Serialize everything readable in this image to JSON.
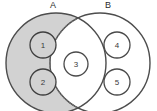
{
  "diagram": {
    "type": "venn-two-set",
    "width": 157,
    "height": 111,
    "background_color": "#ffffff",
    "sets": [
      {
        "id": "A",
        "label": "A",
        "label_x": 53,
        "label_y": 6,
        "cx": 56,
        "cy": 63,
        "r": 50,
        "fill_color": "#d2d2d2",
        "stroke_color": "#4d4d4d",
        "stroke_style": "solid",
        "shaded": true
      },
      {
        "id": "B",
        "label": "B",
        "label_x": 108,
        "label_y": 6,
        "cx": 100,
        "cy": 63,
        "r": 50,
        "fill_color": "#ffffff",
        "stroke_color": "#4d4d4d",
        "stroke_style": "solid-right-dotted-left",
        "shaded": false
      }
    ],
    "intersection": {
      "fill_color": "#ffffff",
      "boundary_style": "dotted",
      "boundary_color": "#6e6e6e"
    },
    "elements": [
      {
        "label": "1",
        "cx": 43,
        "cy": 45,
        "r": 13,
        "region": "A-only",
        "fill_color": "#d2d2d2",
        "stroke_color": "#3f3f3f"
      },
      {
        "label": "2",
        "cx": 43,
        "cy": 82,
        "r": 13,
        "region": "A-only",
        "fill_color": "#d2d2d2",
        "stroke_color": "#3f3f3f"
      },
      {
        "label": "3",
        "cx": 76,
        "cy": 64,
        "r": 12,
        "region": "intersection",
        "fill_color": "#ffffff",
        "stroke_color": "#4a4a4a"
      },
      {
        "label": "4",
        "cx": 117,
        "cy": 45,
        "r": 13,
        "region": "B-only",
        "fill_color": "#ffffff",
        "stroke_color": "#4a4a4a"
      },
      {
        "label": "5",
        "cx": 117,
        "cy": 82,
        "r": 13,
        "region": "B-only",
        "fill_color": "#ffffff",
        "stroke_color": "#4a4a4a"
      }
    ]
  }
}
